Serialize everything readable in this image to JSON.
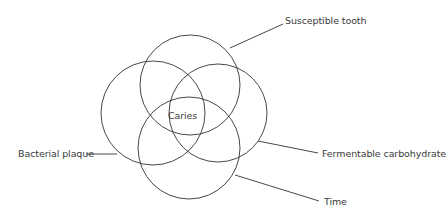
{
  "diagram": {
    "type": "venn",
    "center_label": "Caries",
    "circles": [
      {
        "id": "susceptible-tooth",
        "label": "Susceptible tooth",
        "cx": 190,
        "cy": 85,
        "r": 50
      },
      {
        "id": "bacterial-plaque",
        "label": "Bacterial plaque",
        "cx": 153,
        "cy": 113,
        "r": 52
      },
      {
        "id": "fermentable-carbohydrate",
        "label": "Fermentable carbohydrate",
        "cx": 218,
        "cy": 113,
        "r": 49
      },
      {
        "id": "time",
        "label": "Time",
        "cx": 189,
        "cy": 148,
        "r": 51
      }
    ],
    "leaders": [
      {
        "id": "susceptible-tooth",
        "x1": 230,
        "y1": 48,
        "x2": 283,
        "y2": 24
      },
      {
        "id": "bacterial-plaque",
        "x1": 86,
        "y1": 154,
        "x2": 117,
        "y2": 154
      },
      {
        "id": "fermentable-carbohydrate",
        "x1": 258,
        "y1": 141,
        "x2": 318,
        "y2": 153
      },
      {
        "id": "time",
        "x1": 235,
        "y1": 175,
        "x2": 319,
        "y2": 201
      }
    ],
    "colors": {
      "stroke": "#333333",
      "text": "#3a3a3a",
      "background": "#ffffff"
    }
  }
}
